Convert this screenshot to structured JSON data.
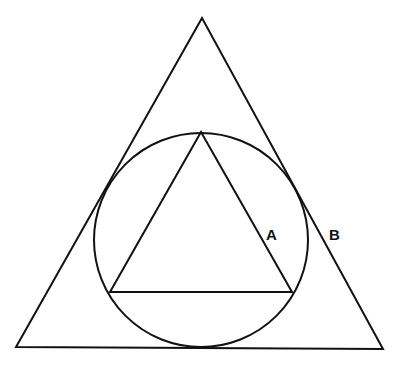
{
  "diagram": {
    "type": "geometry",
    "stroke_color": "#111111",
    "background": "#ffffff",
    "outer_triangle": {
      "points": [
        [
          202,
          18
        ],
        [
          16,
          347
        ],
        [
          383,
          349
        ]
      ]
    },
    "circle": {
      "cx": 201,
      "cy": 240,
      "r": 107
    },
    "inner_triangle": {
      "points": [
        [
          201,
          132
        ],
        [
          110,
          292
        ],
        [
          292,
          292
        ]
      ]
    },
    "labels": [
      {
        "text": "A",
        "x": 266,
        "y": 240
      },
      {
        "text": "B",
        "x": 329,
        "y": 240
      }
    ]
  }
}
